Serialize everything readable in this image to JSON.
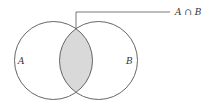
{
  "diagram": {
    "type": "venn",
    "sets": [
      {
        "label": "A",
        "cx": 53.5,
        "cy": 60.5,
        "r": 39
      },
      {
        "label": "B",
        "cx": 98.5,
        "cy": 60.5,
        "r": 39
      }
    ],
    "intersection": {
      "label": "A ∩ B",
      "fill": "#d9d9d9"
    },
    "colors": {
      "stroke": "#555555",
      "background": "#ffffff"
    }
  }
}
